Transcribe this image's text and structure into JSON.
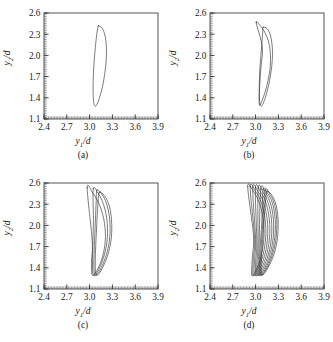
{
  "figure": {
    "title": "",
    "background": "#ffffff",
    "curve_color": "#2b2b2b",
    "frame_color": "#555555"
  },
  "axes": {
    "xlabel": "y1/d",
    "xlabel_base": "y",
    "xlabel_sub": "1",
    "xlabel_suffix": "/d",
    "ylabel": "y2/d",
    "ylabel_base": "y",
    "ylabel_sub": "2",
    "ylabel_suffix": "/d",
    "xticks": [
      "2.4",
      "2.7",
      "3.0",
      "3.3",
      "3.6",
      "3.9"
    ],
    "yticks": [
      "2.6",
      "2.3",
      "2.0",
      "1.7",
      "1.4",
      "1.1"
    ],
    "xlim": [
      2.4,
      3.9
    ],
    "ylim": [
      1.1,
      2.6
    ],
    "grid": false
  },
  "panels": [
    {
      "id": "a",
      "caption": "(a)",
      "loops": 1,
      "description": "period-1 closed orbit"
    },
    {
      "id": "b",
      "caption": "(b)",
      "loops": 2,
      "description": "period-2 orbit"
    },
    {
      "id": "c",
      "caption": "(c)",
      "loops": 4,
      "description": "period-4 orbit"
    },
    {
      "id": "d",
      "caption": "(d)",
      "loops": 9,
      "description": "chaotic / multi-period orbit"
    }
  ],
  "chart_data": {
    "type": "line",
    "title": "",
    "xlabel": "y1/d",
    "ylabel": "y2/d",
    "xlim": [
      2.4,
      3.9
    ],
    "ylim": [
      1.1,
      2.6
    ],
    "xticks": [
      2.4,
      2.7,
      3.0,
      3.3,
      3.6,
      3.9
    ],
    "yticks": [
      1.1,
      1.4,
      1.7,
      2.0,
      2.3,
      2.6
    ],
    "grid": false,
    "legend": null,
    "subplots": [
      {
        "label": "(a)",
        "series": [
          {
            "name": "orbit-1",
            "x": [
              3.115,
              3.16,
              3.196,
              3.215,
              3.222,
              3.22,
              3.212,
              3.2,
              3.186,
              3.17,
              3.152,
              3.133,
              3.114,
              3.096,
              3.08,
              3.066,
              3.055,
              3.048,
              3.046,
              3.05,
              3.06,
              3.075,
              3.092,
              3.108,
              3.115
            ],
            "y": [
              2.42,
              2.39,
              2.31,
              2.2,
              2.08,
              1.96,
              1.85,
              1.745,
              1.65,
              1.56,
              1.48,
              1.41,
              1.35,
              1.305,
              1.282,
              1.29,
              1.33,
              1.42,
              1.56,
              1.73,
              1.92,
              2.11,
              2.28,
              2.39,
              2.42
            ]
          }
        ]
      },
      {
        "label": "(b)",
        "series": [
          {
            "name": "orbit-1",
            "x": [
              3.1,
              3.15,
              3.19,
              3.212,
              3.222,
              3.22,
              3.212,
              3.199,
              3.184,
              3.167,
              3.149,
              3.13,
              3.111,
              3.094,
              3.078,
              3.065,
              3.055,
              3.049,
              3.048,
              3.053,
              3.064,
              3.079,
              3.094,
              3.1
            ],
            "y": [
              2.4,
              2.38,
              2.3,
              2.19,
              2.07,
              1.95,
              1.84,
              1.738,
              1.644,
              1.556,
              1.478,
              1.408,
              1.35,
              1.306,
              1.284,
              1.292,
              1.332,
              1.424,
              1.566,
              1.738,
              1.928,
              2.118,
              2.33,
              2.4
            ]
          },
          {
            "name": "orbit-2",
            "x": [
              3.008,
              3.06,
              3.12,
              3.166,
              3.19,
              3.196,
              3.192,
              3.18,
              3.163,
              3.144,
              3.124,
              3.104,
              3.086,
              3.07,
              3.058,
              3.05,
              3.046,
              3.048,
              3.056,
              3.07,
              3.088,
              3.008
            ],
            "y": [
              2.465,
              2.42,
              2.33,
              2.21,
              2.08,
              1.955,
              1.84,
              1.736,
              1.642,
              1.556,
              1.48,
              1.414,
              1.36,
              1.32,
              1.296,
              1.3,
              1.345,
              1.45,
              1.61,
              1.83,
              2.12,
              2.465
            ]
          }
        ]
      },
      {
        "label": "(c)",
        "series": [
          {
            "name": "orbit-1",
            "x": [
              3.128,
              3.19,
              3.24,
              3.272,
              3.288,
              3.292,
              3.286,
              3.272,
              3.252,
              3.228,
              3.202,
              3.176,
              3.15,
              3.126,
              3.105,
              3.089,
              3.078,
              3.074,
              3.078,
              3.09,
              3.108,
              3.128
            ],
            "y": [
              2.47,
              2.425,
              2.335,
              2.215,
              2.08,
              1.948,
              1.828,
              1.722,
              1.628,
              1.546,
              1.474,
              1.412,
              1.36,
              1.32,
              1.295,
              1.3,
              1.345,
              1.455,
              1.64,
              1.92,
              2.28,
              2.47
            ]
          },
          {
            "name": "orbit-2",
            "x": [
              3.096,
              3.156,
              3.208,
              3.244,
              3.264,
              3.27,
              3.265,
              3.252,
              3.232,
              3.208,
              3.182,
              3.156,
              3.13,
              3.106,
              3.086,
              3.07,
              3.06,
              3.056,
              3.06,
              3.072,
              3.086,
              3.096
            ],
            "y": [
              2.5,
              2.45,
              2.35,
              2.225,
              2.09,
              1.955,
              1.833,
              1.724,
              1.628,
              1.544,
              1.47,
              1.406,
              1.354,
              1.314,
              1.29,
              1.296,
              1.342,
              1.455,
              1.65,
              1.95,
              2.32,
              2.5
            ]
          },
          {
            "name": "orbit-3",
            "x": [
              3.048,
              3.108,
              3.162,
              3.202,
              3.226,
              3.236,
              3.234,
              3.222,
              3.204,
              3.182,
              3.157,
              3.132,
              3.107,
              3.084,
              3.064,
              3.05,
              3.041,
              3.038,
              3.042,
              3.05,
              3.048
            ],
            "y": [
              2.52,
              2.462,
              2.356,
              2.228,
              2.092,
              1.956,
              1.832,
              1.722,
              1.625,
              1.54,
              1.466,
              1.402,
              1.35,
              1.31,
              1.288,
              1.296,
              1.348,
              1.47,
              1.7,
              2.08,
              2.52
            ]
          },
          {
            "name": "orbit-4",
            "x": [
              2.968,
              3.035,
              3.098,
              3.15,
              3.186,
              3.204,
              3.208,
              3.2,
              3.185,
              3.164,
              3.14,
              3.114,
              3.089,
              3.066,
              3.047,
              3.033,
              3.026,
              3.026,
              3.034,
              2.968
            ],
            "y": [
              2.53,
              2.47,
              2.362,
              2.232,
              2.094,
              1.956,
              1.83,
              1.718,
              1.62,
              1.534,
              1.46,
              1.398,
              1.348,
              1.31,
              1.29,
              1.302,
              1.362,
              1.51,
              1.79,
              2.53
            ]
          }
        ]
      },
      {
        "label": "(d)",
        "series": [
          {
            "name": "orbit-1",
            "x": [
              3.15,
              3.21,
              3.256,
              3.284,
              3.296,
              3.296,
              3.288,
              3.272,
              3.25,
              3.224,
              3.196,
              3.168,
              3.141,
              3.117,
              3.097,
              3.082,
              3.074,
              3.074,
              3.084,
              3.104,
              3.128,
              3.15
            ],
            "y": [
              2.48,
              2.43,
              2.335,
              2.21,
              2.075,
              1.942,
              1.822,
              1.716,
              1.622,
              1.54,
              1.47,
              1.41,
              1.36,
              1.322,
              1.298,
              1.302,
              1.348,
              1.46,
              1.66,
              1.96,
              2.31,
              2.48
            ]
          },
          {
            "name": "orbit-2",
            "x": [
              3.126,
              3.186,
              3.234,
              3.264,
              3.278,
              3.278,
              3.27,
              3.254,
              3.232,
              3.207,
              3.18,
              3.152,
              3.126,
              3.102,
              3.083,
              3.069,
              3.061,
              3.061,
              3.072,
              3.092,
              3.126
            ],
            "y": [
              2.495,
              2.442,
              2.344,
              2.216,
              2.08,
              1.946,
              1.824,
              1.716,
              1.62,
              1.537,
              1.466,
              1.405,
              1.355,
              1.317,
              1.294,
              1.3,
              1.348,
              1.465,
              1.672,
              1.99,
              2.495
            ]
          },
          {
            "name": "orbit-3",
            "x": [
              3.1,
              3.16,
              3.21,
              3.242,
              3.258,
              3.26,
              3.252,
              3.236,
              3.215,
              3.19,
              3.164,
              3.137,
              3.111,
              3.088,
              3.069,
              3.055,
              3.048,
              3.049,
              3.06,
              3.08,
              3.1
            ],
            "y": [
              2.508,
              2.452,
              2.35,
              2.22,
              2.082,
              1.948,
              1.825,
              1.715,
              1.618,
              1.534,
              1.462,
              1.401,
              1.351,
              1.313,
              1.291,
              1.298,
              1.349,
              1.472,
              1.69,
              2.02,
              2.508
            ]
          },
          {
            "name": "orbit-4",
            "x": [
              3.068,
              3.13,
              3.182,
              3.216,
              3.234,
              3.238,
              3.231,
              3.216,
              3.195,
              3.171,
              3.145,
              3.118,
              3.093,
              3.07,
              3.052,
              3.039,
              3.032,
              3.034,
              3.046,
              3.068
            ],
            "y": [
              2.518,
              2.46,
              2.356,
              2.224,
              2.084,
              1.949,
              1.825,
              1.714,
              1.616,
              1.531,
              1.458,
              1.397,
              1.347,
              1.31,
              1.289,
              1.297,
              1.351,
              1.482,
              1.715,
              2.518
            ]
          },
          {
            "name": "orbit-5",
            "x": [
              3.034,
              3.098,
              3.152,
              3.188,
              3.208,
              3.214,
              3.208,
              3.194,
              3.174,
              3.15,
              3.125,
              3.098,
              3.073,
              3.051,
              3.033,
              3.021,
              3.015,
              3.018,
              3.032,
              3.034
            ],
            "y": [
              2.528,
              2.468,
              2.362,
              2.228,
              2.086,
              1.95,
              1.824,
              1.712,
              1.613,
              1.528,
              1.455,
              1.394,
              1.344,
              1.308,
              1.288,
              1.297,
              1.354,
              1.494,
              1.745,
              2.528
            ]
          },
          {
            "name": "orbit-6",
            "x": [
              2.998,
              3.064,
              3.12,
              3.158,
              3.18,
              3.188,
              3.183,
              3.17,
              3.151,
              3.128,
              3.103,
              3.077,
              3.052,
              3.031,
              3.014,
              3.002,
              2.998,
              3.002,
              3.016,
              2.998
            ],
            "y": [
              2.536,
              2.474,
              2.366,
              2.231,
              2.088,
              1.95,
              1.823,
              1.71,
              1.61,
              1.524,
              1.451,
              1.39,
              1.341,
              1.306,
              1.287,
              1.297,
              1.358,
              1.506,
              1.775,
              2.536
            ]
          },
          {
            "name": "orbit-7",
            "x": [
              2.962,
              3.03,
              3.088,
              3.128,
              3.152,
              3.161,
              3.157,
              3.145,
              3.127,
              3.104,
              3.08,
              3.054,
              3.03,
              3.01,
              2.994,
              2.983,
              2.98,
              2.986,
              3.0,
              2.962
            ],
            "y": [
              2.542,
              2.479,
              2.369,
              2.233,
              2.089,
              1.95,
              1.822,
              1.708,
              1.607,
              1.521,
              1.447,
              1.386,
              1.338,
              1.304,
              1.286,
              1.298,
              1.362,
              1.518,
              1.805,
              2.542
            ]
          },
          {
            "name": "orbit-8",
            "x": [
              2.928,
              2.998,
              3.058,
              3.1,
              3.125,
              3.135,
              3.132,
              3.12,
              3.103,
              3.081,
              3.057,
              3.032,
              3.009,
              2.989,
              2.974,
              2.965,
              2.963,
              2.97,
              2.986,
              2.928
            ],
            "y": [
              2.546,
              2.482,
              2.371,
              2.234,
              2.09,
              1.95,
              1.821,
              1.706,
              1.605,
              1.518,
              1.444,
              1.383,
              1.336,
              1.303,
              1.286,
              1.299,
              1.366,
              1.53,
              1.835,
              2.546
            ]
          },
          {
            "name": "orbit-9",
            "x": [
              2.896,
              2.968,
              3.03,
              3.074,
              3.1,
              3.111,
              3.109,
              3.098,
              3.081,
              3.06,
              3.036,
              3.012,
              2.989,
              2.97,
              2.956,
              2.948,
              2.948,
              2.956,
              2.972,
              2.896
            ],
            "y": [
              2.55,
              2.485,
              2.373,
              2.235,
              2.09,
              1.95,
              1.82,
              1.704,
              1.602,
              1.515,
              1.441,
              1.38,
              1.334,
              1.302,
              1.286,
              1.3,
              1.37,
              1.542,
              1.862,
              2.55
            ]
          }
        ]
      }
    ]
  }
}
